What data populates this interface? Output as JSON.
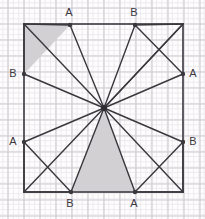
{
  "figure": {
    "type": "geometry-diagram",
    "canvas": {
      "width": 205,
      "height": 219
    },
    "background_color": "#fdfdfd",
    "grid": {
      "visible": true,
      "minor_spacing": 5.3,
      "major_spacing": 16,
      "minor_color": "#e9e5ea",
      "major_color": "#cfc9d2"
    },
    "square": {
      "left": 24,
      "top": 24,
      "right": 183,
      "bottom": 192,
      "stroke_color": "#58555c",
      "stroke_width": 1.9
    },
    "center": {
      "x": 104,
      "y": 108,
      "label": ""
    },
    "shaded_color": "#d2d0d2",
    "line_color": "#3a373d"
  },
  "points": [
    {
      "id": "A-top",
      "label": "A",
      "x": 70,
      "y": 25,
      "label_x": 69,
      "label_y": 13
    },
    {
      "id": "B-top",
      "label": "B",
      "x": 135,
      "y": 25,
      "label_x": 134,
      "label_y": 13
    },
    {
      "id": "B-left",
      "label": "B",
      "x": 24,
      "y": 74,
      "label_x": 13,
      "label_y": 74
    },
    {
      "id": "A-right",
      "label": "A",
      "x": 183,
      "y": 74,
      "label_x": 193,
      "label_y": 74
    },
    {
      "id": "A-left",
      "label": "A",
      "x": 24,
      "y": 142,
      "label_x": 13,
      "label_y": 142
    },
    {
      "id": "B-right",
      "label": "B",
      "x": 183,
      "y": 142,
      "label_x": 193,
      "label_y": 142
    },
    {
      "id": "B-bottom",
      "label": "B",
      "x": 71,
      "y": 192,
      "label_x": 70,
      "label_y": 204
    },
    {
      "id": "A-bottom",
      "label": "A",
      "x": 135,
      "y": 192,
      "label_x": 134,
      "label_y": 204
    }
  ],
  "corners": [
    {
      "id": "corner-tl",
      "x": 24,
      "y": 24
    },
    {
      "id": "corner-tr",
      "x": 183,
      "y": 24
    },
    {
      "id": "corner-br",
      "x": 183,
      "y": 192
    },
    {
      "id": "corner-bl",
      "x": 24,
      "y": 192
    }
  ],
  "rays_from_center": [
    {
      "id": "ray-to-A-top",
      "to_x": 70,
      "to_y": 25
    },
    {
      "id": "ray-to-B-top",
      "to_x": 135,
      "to_y": 25
    },
    {
      "id": "ray-to-B-left",
      "to_x": 24,
      "to_y": 74
    },
    {
      "id": "ray-to-A-right",
      "to_x": 183,
      "to_y": 74
    },
    {
      "id": "ray-to-A-left",
      "to_x": 24,
      "to_y": 142
    },
    {
      "id": "ray-to-B-right",
      "to_x": 183,
      "to_y": 142
    },
    {
      "id": "ray-to-B-bottom",
      "to_x": 71,
      "to_y": 192
    },
    {
      "id": "ray-to-A-bottom",
      "to_x": 135,
      "to_y": 192
    },
    {
      "id": "ray-to-corner-tl",
      "to_x": 24,
      "to_y": 24
    },
    {
      "id": "ray-to-corner-tr",
      "to_x": 183,
      "to_y": 24
    },
    {
      "id": "ray-to-corner-br",
      "to_x": 183,
      "to_y": 192
    },
    {
      "id": "ray-to-corner-bl",
      "to_x": 24,
      "to_y": 192
    }
  ],
  "chords": [
    {
      "id": "chord-tl-1",
      "x1": 24,
      "y1": 24,
      "x2": 70,
      "y2": 25
    },
    {
      "id": "chord-tl-2",
      "x1": 24,
      "y1": 74,
      "x2": 24,
      "y2": 24
    },
    {
      "id": "chord-tr-1",
      "x1": 135,
      "y1": 25,
      "x2": 183,
      "y2": 74
    },
    {
      "id": "chord-tr-2",
      "x1": 183,
      "y1": 24,
      "x2": 135,
      "y2": 25
    },
    {
      "id": "chord-tr-3",
      "x1": 183,
      "y1": 24,
      "x2": 104,
      "y2": 108
    },
    {
      "id": "chord-bl-1",
      "x1": 24,
      "y1": 142,
      "x2": 71,
      "y2": 192
    },
    {
      "id": "chord-bl-2",
      "x1": 24,
      "y1": 192,
      "x2": 24,
      "y2": 142
    },
    {
      "id": "chord-bl-3",
      "x1": 24,
      "y1": 192,
      "x2": 71,
      "y2": 192
    },
    {
      "id": "chord-br-1",
      "x1": 135,
      "y1": 192,
      "x2": 183,
      "y2": 142
    },
    {
      "id": "chord-br-2",
      "x1": 183,
      "y1": 192,
      "x2": 183,
      "y2": 142
    },
    {
      "id": "chord-br-3",
      "x1": 183,
      "y1": 192,
      "x2": 135,
      "y2": 192
    }
  ],
  "shaded_triangles": [
    {
      "id": "shaded-top-left",
      "points": "24,24 70,25 24,74"
    },
    {
      "id": "shaded-bottom-center",
      "points": "104,108 71,192 135,192"
    }
  ]
}
